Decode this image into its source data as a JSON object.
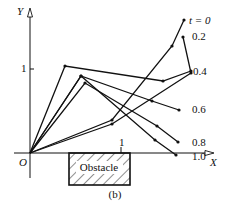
{
  "figure": {
    "caption": "(b)",
    "obstacle_label": "Obstacle",
    "axes": {
      "x_label": "X",
      "y_label": "Y",
      "origin_label": "O",
      "x_tick": "1",
      "y_tick": "1"
    },
    "time_labels": [
      "t = 0",
      "0.2",
      "0.4",
      "0.6",
      "0.8",
      "1.0"
    ],
    "colors": {
      "line": "#111111",
      "background": "#ffffff",
      "hatch": "#222222"
    },
    "configurations": [
      {
        "t": "0",
        "points": [
          [
            30,
            153
          ],
          [
            112,
            120
          ],
          [
            172,
            46
          ],
          [
            184,
            20
          ]
        ]
      },
      {
        "t": "0.2",
        "points": [
          [
            30,
            153
          ],
          [
            112,
            124
          ],
          [
            191,
            73
          ],
          [
            183,
            37
          ]
        ]
      },
      {
        "t": "0.4",
        "points": [
          [
            30,
            153
          ],
          [
            65,
            66
          ],
          [
            163,
            81
          ],
          [
            191,
            71
          ]
        ]
      },
      {
        "t": "0.6",
        "points": [
          [
            30,
            153
          ],
          [
            81,
            76
          ],
          [
            152,
            101
          ],
          [
            179,
            110
          ]
        ]
      },
      {
        "t": "0.8",
        "points": [
          [
            30,
            153
          ],
          [
            85,
            83
          ],
          [
            157,
            126
          ],
          [
            178,
            142
          ]
        ]
      },
      {
        "t": "1.0",
        "points": [
          [
            30,
            153
          ],
          [
            81,
            76
          ],
          [
            155,
            140
          ],
          [
            176,
            155
          ]
        ]
      }
    ]
  }
}
